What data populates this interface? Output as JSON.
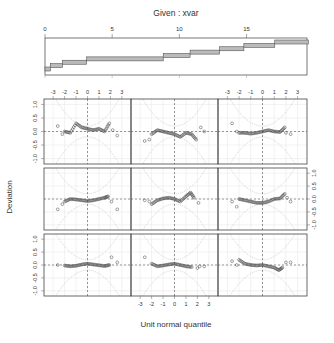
{
  "chart_data": {
    "type": "scatter",
    "plot_kind": "coplot / worm plot (detrended normal Q-Q) conditioned on xvar",
    "given_panel": {
      "title": "Given : xvar",
      "xticks": [
        0,
        5,
        10,
        15
      ],
      "xlim": [
        0,
        19.5
      ],
      "intervals": [
        [
          0.0,
          0.4
        ],
        [
          0.4,
          1.3
        ],
        [
          1.3,
          3.1
        ],
        [
          3.1,
          8.8
        ],
        [
          8.8,
          10.8
        ],
        [
          10.8,
          13.0
        ],
        [
          13.0,
          14.8
        ],
        [
          14.8,
          17.1
        ],
        [
          17.1,
          19.6
        ]
      ]
    },
    "xlabel": "Unit normal quantile",
    "ylabel": "Deviation",
    "xticks": [
      -3,
      -2,
      -1,
      0,
      1,
      2,
      3
    ],
    "yticks": [
      -1.0,
      -0.5,
      0.0,
      0.5,
      1.0
    ],
    "xlim": [
      -3.8,
      3.8
    ],
    "ylim": [
      -1.2,
      1.2
    ],
    "layout": {
      "rows": 3,
      "cols": 3,
      "order": "bottom-left to top-right"
    },
    "panels": [
      {
        "id": 1,
        "row": 3,
        "col": 1,
        "points": [
          [
            -2.6,
            0.0
          ],
          [
            -2.0,
            -0.02
          ],
          [
            -1.5,
            -0.05
          ],
          [
            -1.0,
            -0.03
          ],
          [
            -0.5,
            0.02
          ],
          [
            0.0,
            0.05
          ],
          [
            0.5,
            0.02
          ],
          [
            1.0,
            -0.01
          ],
          [
            1.5,
            -0.04
          ],
          [
            1.9,
            0.0
          ],
          [
            2.1,
            0.3
          ],
          [
            2.6,
            0.1
          ]
        ]
      },
      {
        "id": 2,
        "row": 3,
        "col": 2,
        "points": [
          [
            -2.6,
            0.3
          ],
          [
            -2.0,
            0.05
          ],
          [
            -1.5,
            -0.05
          ],
          [
            -1.0,
            -0.02
          ],
          [
            -0.5,
            0.02
          ],
          [
            0.0,
            0.05
          ],
          [
            0.5,
            0.0
          ],
          [
            1.0,
            -0.05
          ],
          [
            1.5,
            -0.08
          ],
          [
            2.0,
            -0.12
          ],
          [
            2.2,
            -0.05
          ],
          [
            2.6,
            -0.05
          ]
        ]
      },
      {
        "id": 3,
        "row": 3,
        "col": 3,
        "points": [
          [
            -2.6,
            0.15
          ],
          [
            -2.2,
            0.0
          ],
          [
            -2.0,
            0.2
          ],
          [
            -1.5,
            0.05
          ],
          [
            -1.0,
            0.0
          ],
          [
            -0.5,
            -0.02
          ],
          [
            0.0,
            0.0
          ],
          [
            0.5,
            -0.05
          ],
          [
            1.0,
            -0.1
          ],
          [
            1.4,
            -0.2
          ],
          [
            1.7,
            -0.1
          ],
          [
            2.0,
            0.1
          ],
          [
            2.4,
            0.1
          ]
        ]
      },
      {
        "id": 4,
        "row": 2,
        "col": 1,
        "points": [
          [
            -2.6,
            -0.4
          ],
          [
            -2.2,
            -0.2
          ],
          [
            -2.0,
            -0.1
          ],
          [
            -1.5,
            0.0
          ],
          [
            -1.0,
            -0.02
          ],
          [
            -0.5,
            -0.05
          ],
          [
            0.0,
            -0.08
          ],
          [
            0.5,
            -0.05
          ],
          [
            1.0,
            0.0
          ],
          [
            1.5,
            0.05
          ],
          [
            1.8,
            0.1
          ],
          [
            2.1,
            -0.1
          ],
          [
            2.6,
            -0.4
          ]
        ]
      },
      {
        "id": 5,
        "row": 2,
        "col": 2,
        "points": [
          [
            -2.6,
            -0.05
          ],
          [
            -2.2,
            -0.1
          ],
          [
            -2.0,
            -0.2
          ],
          [
            -1.5,
            -0.05
          ],
          [
            -1.0,
            0.02
          ],
          [
            -0.5,
            0.05
          ],
          [
            0.0,
            0.0
          ],
          [
            0.5,
            -0.1
          ],
          [
            1.0,
            0.1
          ],
          [
            1.4,
            0.25
          ],
          [
            1.7,
            0.05
          ],
          [
            2.1,
            -0.15
          ]
        ]
      },
      {
        "id": 6,
        "row": 2,
        "col": 3,
        "points": [
          [
            -2.6,
            -0.1
          ],
          [
            -2.2,
            -0.3
          ],
          [
            -2.0,
            0.0
          ],
          [
            -1.5,
            -0.05
          ],
          [
            -1.0,
            -0.1
          ],
          [
            -0.5,
            -0.15
          ],
          [
            0.0,
            -0.15
          ],
          [
            0.5,
            -0.1
          ],
          [
            1.0,
            0.0
          ],
          [
            1.5,
            0.02
          ],
          [
            1.9,
            0.2
          ],
          [
            2.1,
            0.05
          ],
          [
            2.4,
            -0.1
          ]
        ]
      },
      {
        "id": 7,
        "row": 1,
        "col": 1,
        "points": [
          [
            -2.6,
            0.2
          ],
          [
            -2.2,
            -0.1
          ],
          [
            -2.0,
            0.0
          ],
          [
            -1.5,
            -0.05
          ],
          [
            -1.0,
            0.3
          ],
          [
            -0.5,
            0.15
          ],
          [
            0.0,
            0.1
          ],
          [
            0.5,
            0.05
          ],
          [
            1.0,
            0.1
          ],
          [
            1.5,
            0.0
          ],
          [
            1.9,
            0.3
          ],
          [
            2.2,
            0.05
          ],
          [
            2.6,
            -0.15
          ]
        ]
      },
      {
        "id": 8,
        "row": 1,
        "col": 2,
        "points": [
          [
            -2.6,
            -0.35
          ],
          [
            -2.2,
            -0.3
          ],
          [
            -2.0,
            -0.1
          ],
          [
            -1.5,
            0.05
          ],
          [
            -1.0,
            0.0
          ],
          [
            -0.5,
            -0.05
          ],
          [
            0.0,
            -0.1
          ],
          [
            0.5,
            -0.2
          ],
          [
            1.0,
            -0.05
          ],
          [
            1.5,
            -0.1
          ],
          [
            1.9,
            -0.3
          ],
          [
            2.3,
            0.15
          ],
          [
            2.6,
            0.0
          ]
        ]
      },
      {
        "id": 9,
        "row": 1,
        "col": 3,
        "points": [
          [
            -2.6,
            0.3
          ],
          [
            -2.2,
            0.0
          ],
          [
            -2.0,
            -0.05
          ],
          [
            -1.5,
            -0.05
          ],
          [
            -1.0,
            -0.08
          ],
          [
            -0.5,
            -0.05
          ],
          [
            0.0,
            0.0
          ],
          [
            0.5,
            0.05
          ],
          [
            1.0,
            0.0
          ],
          [
            1.5,
            -0.02
          ],
          [
            1.9,
            0.15
          ],
          [
            2.0,
            -0.05
          ],
          [
            2.4,
            -0.1
          ]
        ]
      }
    ],
    "grid": true,
    "reference_lines": {
      "horizontal": 0,
      "vertical": 0,
      "style": "dashed"
    },
    "confidence_bands": "dotted curves"
  },
  "labels": {
    "title": "Given : xvar",
    "xlabel": "Unit normal quantile",
    "ylabel": "Deviation"
  }
}
